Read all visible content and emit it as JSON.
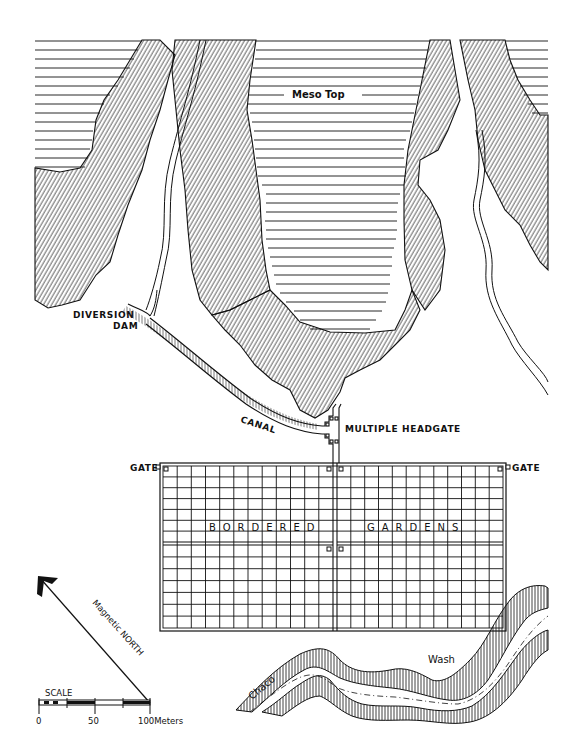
{
  "figure": {
    "type": "site-map"
  },
  "labels": {
    "mesa_top": "Meso Top",
    "diversion_dam_line1": "DIVERSION",
    "diversion_dam_line2": "DAM",
    "canal": "CANAL",
    "multiple_headgate": "MULTIPLE HEADGATE",
    "gate_left": "GATE",
    "gate_right": "GATE",
    "bordered": "BORDERED",
    "gardens": "GARDENS",
    "river_word1": "Chaco",
    "river_word2": "Wash",
    "north_arrow": "Magnetic NORTH"
  },
  "scale_bar": {
    "title": "SCALE",
    "ticks": [
      "0",
      "50",
      "100Meters"
    ],
    "unit": "Meters",
    "max": 100
  },
  "garden_grid": {
    "left_columns": 12,
    "right_columns": 12,
    "top_rows": 7,
    "bottom_rows": 7,
    "gates": 6
  },
  "colors": {
    "ink": "#111111",
    "paper": "#ffffff"
  }
}
